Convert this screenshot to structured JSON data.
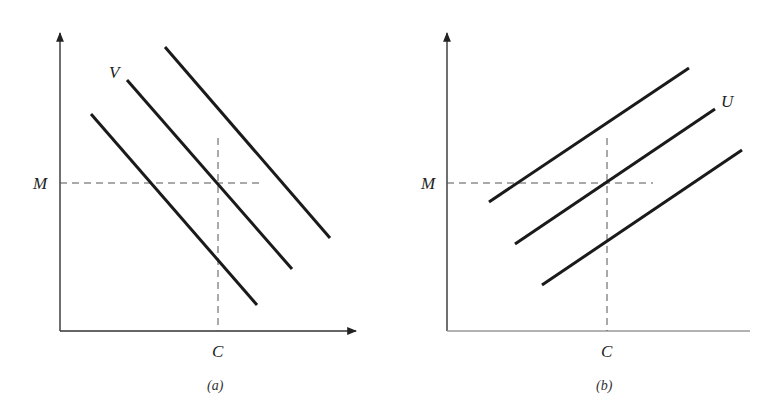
{
  "figure": {
    "panel_a": {
      "caption": "(a)",
      "y_label": "M",
      "x_label": "C",
      "curve_label": "V",
      "line_slope": "negative",
      "line_count": 3
    },
    "panel_b": {
      "caption": "(b)",
      "y_label": "M",
      "x_label": "C",
      "curve_label": "U",
      "line_slope": "positive",
      "line_count": 3
    },
    "colors": {
      "line": "#1a1a1a",
      "axis": "#333333",
      "guide": "#555555",
      "background": "#ffffff"
    }
  }
}
